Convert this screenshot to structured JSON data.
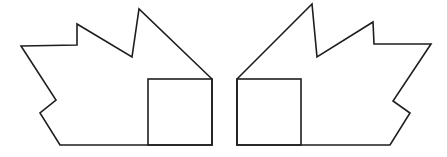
{
  "canvas": {
    "width": 447,
    "height": 157,
    "background": "#ffffff"
  },
  "stroke_color": "#1e1e1e",
  "figures": [
    {
      "name": "left-figure",
      "outline_points": "21,46 77,45 77,24 132,57 139,9 212,79 212,145 60,145 40,113 56,100",
      "inner_rect": {
        "x": 148,
        "y": 79,
        "width": 64,
        "height": 66
      }
    },
    {
      "name": "right-figure",
      "outline_points": "237,79 312,4 317,57 373,22 374,44 431,44 393,101 410,113 390,145 237,145",
      "inner_rect": {
        "x": 237,
        "y": 79,
        "width": 64,
        "height": 66
      }
    }
  ]
}
